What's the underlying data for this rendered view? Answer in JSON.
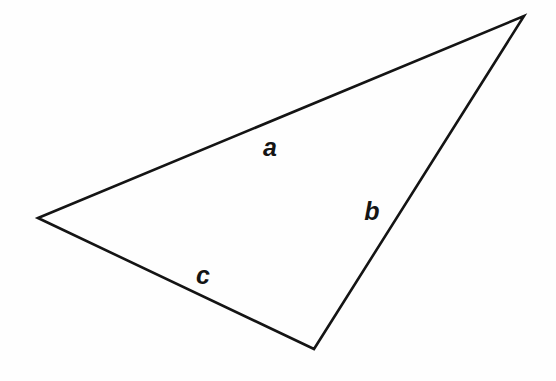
{
  "figure": {
    "kind": "geometry-diagram",
    "shape": "triangle",
    "background_color": "#fefefe",
    "stroke_color": "#141414",
    "stroke_width": 2.6,
    "canvas": {
      "width": 556,
      "height": 381
    },
    "vertices": [
      {
        "name": "left-vertex",
        "x": 38,
        "y": 218
      },
      {
        "name": "top-right-vertex",
        "x": 524,
        "y": 16
      },
      {
        "name": "bottom-vertex",
        "x": 314,
        "y": 349
      }
    ],
    "path": "M 38 218 L 524 16 L 314 349 Z",
    "labels": [
      {
        "name": "side-label-a",
        "text": "a",
        "x": 270,
        "y": 147,
        "side": "top-edge"
      },
      {
        "name": "side-label-b",
        "text": "b",
        "x": 372,
        "y": 211,
        "side": "right-edge"
      },
      {
        "name": "side-label-c",
        "text": "c",
        "x": 203,
        "y": 275,
        "side": "bottom-left-edge"
      }
    ]
  }
}
